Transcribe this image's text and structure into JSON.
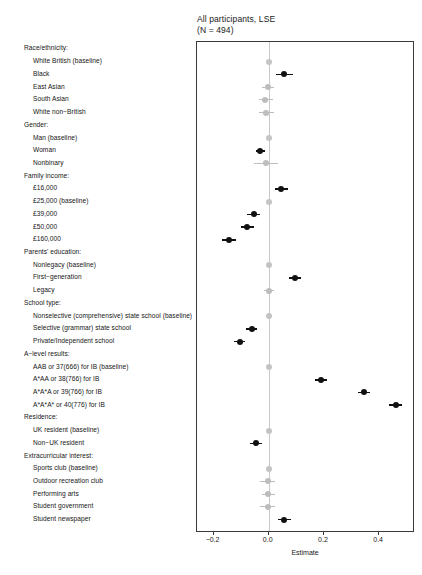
{
  "chart_data": {
    "type": "scatter",
    "title_line1": "All participants, LSE",
    "title_line2": "(N = 494)",
    "xlabel": "Estimate",
    "ylabel": "",
    "grid": false,
    "legend": "none",
    "reference_line": 0.0,
    "xlim": [
      -0.26,
      0.53
    ],
    "xticks": [
      -0.2,
      0.0,
      0.2,
      0.4
    ],
    "xticklabels": [
      "−0.2",
      "0.0",
      "0.2",
      "0.4"
    ],
    "colors": {
      "significant": "#111111",
      "nonsignificant": "#bdbdbd",
      "baseline": "#c4c4c4",
      "reference_line": "#c9c9c9",
      "panel_border": "#3a3a3a"
    },
    "groups": [
      {
        "header": "Race/ethnicity:",
        "points": [
          {
            "label": "White British (baseline)",
            "estimate": 0.0,
            "ci_low": 0.0,
            "ci_high": 0.0,
            "kind": "baseline"
          },
          {
            "label": "Black",
            "estimate": 0.055,
            "ci_low": 0.028,
            "ci_high": 0.088,
            "kind": "significant"
          },
          {
            "label": "East Asian",
            "estimate": -0.002,
            "ci_low": -0.024,
            "ci_high": 0.02,
            "kind": "nonsignificant"
          },
          {
            "label": "South Asian",
            "estimate": -0.012,
            "ci_low": -0.036,
            "ci_high": 0.014,
            "kind": "nonsignificant"
          },
          {
            "label": "White non−British",
            "estimate": -0.01,
            "ci_low": -0.035,
            "ci_high": 0.018,
            "kind": "nonsignificant"
          }
        ]
      },
      {
        "header": "Gender:",
        "points": [
          {
            "label": "Man (baseline)",
            "estimate": 0.0,
            "ci_low": 0.0,
            "ci_high": 0.0,
            "kind": "baseline"
          },
          {
            "label": "Woman",
            "estimate": -0.032,
            "ci_low": -0.048,
            "ci_high": -0.014,
            "kind": "significant"
          },
          {
            "label": "Nonbinary",
            "estimate": -0.01,
            "ci_low": -0.055,
            "ci_high": 0.032,
            "kind": "nonsignificant"
          }
        ]
      },
      {
        "header": "Family income:",
        "points": [
          {
            "label": "£16,000",
            "estimate": 0.045,
            "ci_low": 0.022,
            "ci_high": 0.07,
            "kind": "significant"
          },
          {
            "label": "£25,000 (baseline)",
            "estimate": 0.0,
            "ci_low": 0.0,
            "ci_high": 0.0,
            "kind": "baseline"
          },
          {
            "label": "£39,000",
            "estimate": -0.055,
            "ci_low": -0.078,
            "ci_high": -0.032,
            "kind": "significant"
          },
          {
            "label": "£50,000",
            "estimate": -0.077,
            "ci_low": -0.1,
            "ci_high": -0.055,
            "kind": "significant"
          },
          {
            "label": "£160,000",
            "estimate": -0.143,
            "ci_low": -0.17,
            "ci_high": -0.118,
            "kind": "significant"
          }
        ]
      },
      {
        "header": "Parents' education:",
        "points": [
          {
            "label": "Nonlegacy (baseline)",
            "estimate": 0.0,
            "ci_low": 0.0,
            "ci_high": 0.0,
            "kind": "baseline"
          },
          {
            "label": "First−generation",
            "estimate": 0.095,
            "ci_low": 0.072,
            "ci_high": 0.118,
            "kind": "significant"
          },
          {
            "label": "Legacy",
            "estimate": 0.0,
            "ci_low": -0.018,
            "ci_high": 0.018,
            "kind": "nonsignificant"
          }
        ]
      },
      {
        "header": "School type:",
        "points": [
          {
            "label": "Nonselective (comprehensive) state school (baseline)",
            "estimate": 0.0,
            "ci_low": 0.0,
            "ci_high": 0.0,
            "kind": "baseline"
          },
          {
            "label": "Selective (grammar) state school",
            "estimate": -0.062,
            "ci_low": -0.082,
            "ci_high": -0.042,
            "kind": "significant"
          },
          {
            "label": "Private/Independent school",
            "estimate": -0.105,
            "ci_low": -0.125,
            "ci_high": -0.085,
            "kind": "significant"
          }
        ]
      },
      {
        "header": "A−level results:",
        "points": [
          {
            "label": "AAB or 37(666) for IB (baseline)",
            "estimate": 0.0,
            "ci_low": 0.0,
            "ci_high": 0.0,
            "kind": "baseline"
          },
          {
            "label": "A*AA or 38(766) for IB",
            "estimate": 0.19,
            "ci_low": 0.168,
            "ci_high": 0.212,
            "kind": "significant"
          },
          {
            "label": "A*A*A or 39(766) for IB",
            "estimate": 0.345,
            "ci_low": 0.322,
            "ci_high": 0.368,
            "kind": "significant"
          },
          {
            "label": "A*A*A* or 40(776) for IB",
            "estimate": 0.46,
            "ci_low": 0.436,
            "ci_high": 0.484,
            "kind": "significant"
          }
        ]
      },
      {
        "header": "Residence:",
        "points": [
          {
            "label": "UK resident (baseline)",
            "estimate": 0.0,
            "ci_low": 0.0,
            "ci_high": 0.0,
            "kind": "baseline"
          },
          {
            "label": "Non−UK resident",
            "estimate": -0.047,
            "ci_low": -0.068,
            "ci_high": -0.026,
            "kind": "significant"
          }
        ]
      },
      {
        "header": "Extracurricular interest:",
        "points": [
          {
            "label": "Sports club (baseline)",
            "estimate": 0.0,
            "ci_low": 0.0,
            "ci_high": 0.0,
            "kind": "baseline"
          },
          {
            "label": "Outdoor recreation club",
            "estimate": -0.003,
            "ci_low": -0.03,
            "ci_high": 0.024,
            "kind": "nonsignificant"
          },
          {
            "label": "Performing arts",
            "estimate": -0.002,
            "ci_low": -0.026,
            "ci_high": 0.022,
            "kind": "nonsignificant"
          },
          {
            "label": "Student government",
            "estimate": -0.004,
            "ci_low": -0.03,
            "ci_high": 0.022,
            "kind": "nonsignificant"
          },
          {
            "label": "Student newspaper",
            "estimate": 0.055,
            "ci_low": 0.032,
            "ci_high": 0.08,
            "kind": "significant"
          }
        ]
      }
    ]
  }
}
